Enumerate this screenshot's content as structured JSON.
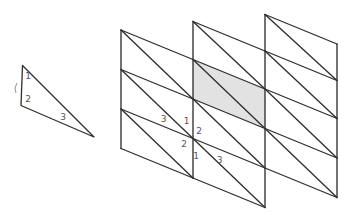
{
  "figure": {
    "background": "#ffffff",
    "stroke_color": "#2f2f2f",
    "label_color": "#555555",
    "shaded_fill": "#e2e2e2",
    "reference_triangle": {
      "vertices": [
        [
          22.5,
          65.5
        ],
        [
          21,
          105.5
        ],
        [
          94,
          137
        ]
      ],
      "tick_mark_path": "M 17,83 q -3.5,5 -1,10",
      "edge_labels": [
        {
          "text": "1",
          "x": 28,
          "y": 76
        },
        {
          "text": "2",
          "x": 28,
          "y": 98.5
        },
        {
          "text": "3",
          "x": 63,
          "y": 117
        }
      ]
    },
    "mesh": {
      "shaded_cell": [
        [
          193,
          59.5
        ],
        [
          265,
          89
        ],
        [
          265,
          128.5
        ],
        [
          193,
          99
        ]
      ],
      "lines": [
        [
          121,
          30,
          121,
          148.5
        ],
        [
          193,
          21.5,
          193,
          178
        ],
        [
          265,
          14.5,
          265,
          207.5
        ],
        [
          337,
          44,
          337,
          197.5
        ],
        [
          121,
          30,
          193,
          59.5
        ],
        [
          121,
          69.5,
          193,
          99
        ],
        [
          121,
          109,
          193,
          138.5
        ],
        [
          121,
          148.5,
          193,
          178
        ],
        [
          121,
          30,
          193,
          99
        ],
        [
          121,
          69.5,
          193,
          138.5
        ],
        [
          121,
          109,
          193,
          178
        ],
        [
          193,
          21.5,
          265,
          51
        ],
        [
          193,
          59.5,
          265,
          89
        ],
        [
          193,
          99,
          265,
          128.5
        ],
        [
          193,
          138.5,
          265,
          168
        ],
        [
          193,
          178,
          265,
          207.5
        ],
        [
          193,
          21.5,
          265,
          89
        ],
        [
          193,
          59.5,
          265,
          128.5
        ],
        [
          193,
          99,
          265,
          168
        ],
        [
          193,
          138.5,
          265,
          207.5
        ],
        [
          265,
          14.5,
          337,
          44
        ],
        [
          265,
          51,
          337,
          80.5
        ],
        [
          265,
          89,
          337,
          118.5
        ],
        [
          265,
          128.5,
          337,
          158
        ],
        [
          265,
          168,
          337,
          197.5
        ],
        [
          265,
          14.5,
          337,
          80.5
        ],
        [
          265,
          51,
          337,
          118.5
        ],
        [
          265,
          89,
          337,
          158
        ],
        [
          265,
          128.5,
          337,
          197.5
        ]
      ],
      "edge_labels": [
        {
          "text": "3",
          "x": 163.5,
          "y": 119
        },
        {
          "text": "1",
          "x": 186.5,
          "y": 120.5
        },
        {
          "text": "2",
          "x": 199,
          "y": 131
        },
        {
          "text": "2",
          "x": 184,
          "y": 143.5
        },
        {
          "text": "1",
          "x": 196,
          "y": 155.5
        },
        {
          "text": "3",
          "x": 219.5,
          "y": 159.5
        }
      ]
    }
  }
}
